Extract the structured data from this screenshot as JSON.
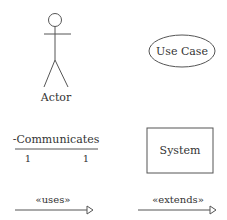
{
  "diagram": {
    "type": "UML use case notation legend",
    "colors": {
      "stroke": "#555555",
      "text": "#333333",
      "background": "#ffffff"
    },
    "actor": {
      "label": "Actor",
      "icon": "stick-figure-icon"
    },
    "use_case": {
      "label": "Use Case",
      "shape": "ellipse"
    },
    "association": {
      "label": "-Communicates",
      "multiplicity_left": "1",
      "multiplicity_right": "1"
    },
    "system": {
      "label": "System",
      "shape": "rectangle"
    },
    "uses": {
      "label": "«uses»",
      "arrow": "hollow-triangle-arrow"
    },
    "extends": {
      "label": "«extends»",
      "arrow": "hollow-triangle-arrow"
    }
  }
}
